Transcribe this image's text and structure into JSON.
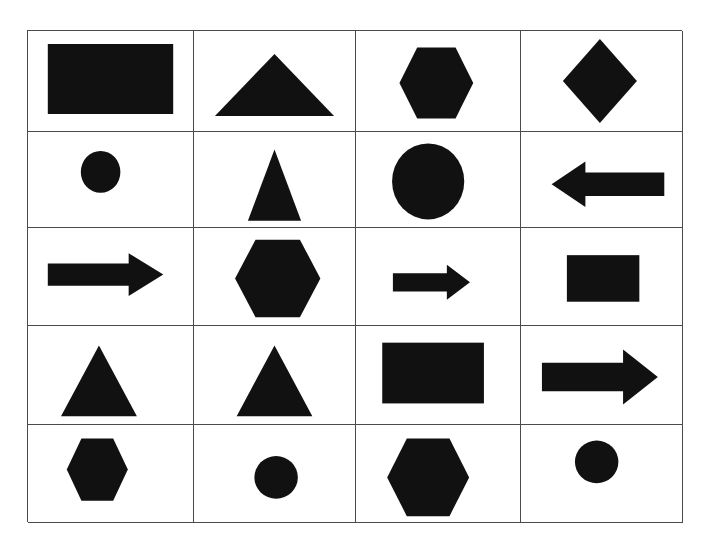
{
  "figure": {
    "title": "",
    "background_color": "#ffffff",
    "shape_color": "#111111",
    "border_color": "#4a4a4a",
    "grid_rows": 5,
    "grid_columns": 4
  },
  "chart_data": {
    "type": "table",
    "title": "",
    "subtitle": "",
    "xlabel": "",
    "ylabel": "",
    "grid": true,
    "legend_position": "none",
    "categories": [
      "Column 1",
      "Column 2",
      "Column 3",
      "Column 4"
    ],
    "row_labels": [
      "Row 1",
      "Row 2",
      "Row 3",
      "Row 4",
      "Row 5"
    ],
    "shape_color": "#111111",
    "cells": [
      {
        "row": 1,
        "col": 1,
        "shape": "rectangle",
        "label": "black rectangle",
        "fill": "#111111",
        "width_frac": 0.76,
        "height_frac": 0.7,
        "center_x_frac": 0.5,
        "center_y_frac": 0.48
      },
      {
        "row": 1,
        "col": 2,
        "shape": "triangle",
        "label": "wide flat triangle",
        "fill": "#111111",
        "width_frac": 0.74,
        "height_frac": 0.62,
        "center_x_frac": 0.5,
        "center_y_frac": 0.54
      },
      {
        "row": 1,
        "col": 3,
        "shape": "hexagon",
        "label": "hexagon",
        "fill": "#111111",
        "width_frac": 0.45,
        "height_frac": 0.71,
        "center_x_frac": 0.49,
        "center_y_frac": 0.52
      },
      {
        "row": 1,
        "col": 4,
        "shape": "diamond",
        "label": "diamond",
        "fill": "#111111",
        "width_frac": 0.46,
        "height_frac": 0.84,
        "center_x_frac": 0.49,
        "center_y_frac": 0.5
      },
      {
        "row": 2,
        "col": 1,
        "shape": "circle",
        "label": "small circle",
        "fill": "#111111",
        "width_frac": 0.24,
        "height_frac": 0.44,
        "center_x_frac": 0.44,
        "center_y_frac": 0.42
      },
      {
        "row": 2,
        "col": 2,
        "shape": "triangle",
        "label": "narrow tall triangle",
        "fill": "#111111",
        "width_frac": 0.33,
        "height_frac": 0.75,
        "center_x_frac": 0.5,
        "center_y_frac": 0.56
      },
      {
        "row": 2,
        "col": 3,
        "shape": "circle",
        "label": "large circle",
        "fill": "#111111",
        "width_frac": 0.44,
        "height_frac": 0.8,
        "center_x_frac": 0.44,
        "center_y_frac": 0.52
      },
      {
        "row": 2,
        "col": 4,
        "shape": "arrow-left",
        "label": "left pointing arrow",
        "fill": "#111111",
        "width_frac": 0.7,
        "height_frac": 0.48,
        "center_x_frac": 0.54,
        "center_y_frac": 0.55
      },
      {
        "row": 3,
        "col": 1,
        "shape": "arrow-right",
        "label": "right pointing arrow",
        "fill": "#111111",
        "width_frac": 0.7,
        "height_frac": 0.44,
        "center_x_frac": 0.47,
        "center_y_frac": 0.48
      },
      {
        "row": 3,
        "col": 2,
        "shape": "hexagon",
        "label": "large hexagon",
        "fill": "#111111",
        "width_frac": 0.53,
        "height_frac": 0.8,
        "center_x_frac": 0.52,
        "center_y_frac": 0.52
      },
      {
        "row": 3,
        "col": 3,
        "shape": "arrow-right",
        "label": "small right pointing arrow",
        "fill": "#111111",
        "width_frac": 0.47,
        "height_frac": 0.36,
        "center_x_frac": 0.46,
        "center_y_frac": 0.56
      },
      {
        "row": 3,
        "col": 4,
        "shape": "rectangle",
        "label": "medium rectangle",
        "fill": "#111111",
        "width_frac": 0.45,
        "height_frac": 0.48,
        "center_x_frac": 0.51,
        "center_y_frac": 0.52
      },
      {
        "row": 4,
        "col": 1,
        "shape": "triangle",
        "label": "triangle",
        "fill": "#111111",
        "width_frac": 0.46,
        "height_frac": 0.72,
        "center_x_frac": 0.43,
        "center_y_frac": 0.56
      },
      {
        "row": 4,
        "col": 2,
        "shape": "triangle",
        "label": "triangle",
        "fill": "#111111",
        "width_frac": 0.47,
        "height_frac": 0.72,
        "center_x_frac": 0.5,
        "center_y_frac": 0.56
      },
      {
        "row": 4,
        "col": 3,
        "shape": "rectangle",
        "label": "large rectangle",
        "fill": "#111111",
        "width_frac": 0.62,
        "height_frac": 0.62,
        "center_x_frac": 0.47,
        "center_y_frac": 0.48
      },
      {
        "row": 4,
        "col": 4,
        "shape": "arrow-right",
        "label": "large right pointing arrow",
        "fill": "#111111",
        "width_frac": 0.72,
        "height_frac": 0.56,
        "center_x_frac": 0.49,
        "center_y_frac": 0.52
      },
      {
        "row": 5,
        "col": 1,
        "shape": "hexagon",
        "label": "hexagon",
        "fill": "#111111",
        "width_frac": 0.37,
        "height_frac": 0.64,
        "center_x_frac": 0.42,
        "center_y_frac": 0.46
      },
      {
        "row": 5,
        "col": 2,
        "shape": "circle",
        "label": "small circle",
        "fill": "#111111",
        "width_frac": 0.27,
        "height_frac": 0.44,
        "center_x_frac": 0.51,
        "center_y_frac": 0.54
      },
      {
        "row": 5,
        "col": 3,
        "shape": "hexagon",
        "label": "large hexagon",
        "fill": "#111111",
        "width_frac": 0.5,
        "height_frac": 0.8,
        "center_x_frac": 0.44,
        "center_y_frac": 0.54
      },
      {
        "row": 5,
        "col": 4,
        "shape": "circle",
        "label": "small circle",
        "fill": "#111111",
        "width_frac": 0.27,
        "height_frac": 0.44,
        "center_x_frac": 0.47,
        "center_y_frac": 0.38
      }
    ]
  }
}
